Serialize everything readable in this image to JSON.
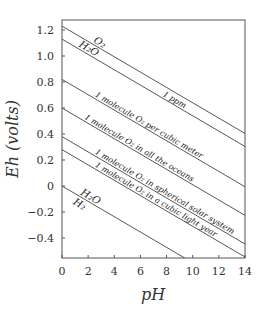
{
  "chart_data": {
    "type": "line",
    "title": "",
    "xlabel": "pH",
    "ylabel": "Eh  (volts)",
    "xlim": [
      0,
      14
    ],
    "ylim": [
      -0.55,
      1.28
    ],
    "xticks": [
      0,
      2,
      4,
      6,
      8,
      10,
      12,
      14
    ],
    "xtick_labels": [
      "0",
      "2",
      "4",
      "6",
      "8",
      "10",
      "12",
      "14"
    ],
    "yticks": [
      1.2,
      1.0,
      0.8,
      0.6,
      0.4,
      0.2,
      0,
      -0.2,
      -0.4
    ],
    "ytick_labels": [
      "1.2",
      "1.0",
      "0.8",
      "0.6",
      "0.4",
      "0.2",
      "0",
      "−0.2",
      "−0.4"
    ],
    "grid": false,
    "legend": "none (inline labels)",
    "slope_volts_per_pH": -0.059,
    "series": [
      {
        "name": "O2 / H2O",
        "label_top": "O₂",
        "label_bottom": "H₂O",
        "eh_at_pH0": 1.23,
        "x": [
          0,
          14
        ],
        "y": [
          1.23,
          0.4
        ]
      },
      {
        "name": "1 ppm",
        "label": "1 ppm",
        "eh_at_pH0": 1.13,
        "x": [
          0,
          14
        ],
        "y": [
          1.13,
          0.3
        ]
      },
      {
        "name": "1 molecule O2 per cubic meter",
        "label": "1 molecule O₂ per cubic meter",
        "eh_at_pH0": 0.82,
        "x": [
          0,
          14
        ],
        "y": [
          0.82,
          -0.01
        ]
      },
      {
        "name": "1 molecule O2 in all the oceans",
        "label": "1 molecule O₂ in all the oceans",
        "eh_at_pH0": 0.6,
        "x": [
          0,
          14
        ],
        "y": [
          0.6,
          -0.23
        ]
      },
      {
        "name": "1 molecule O2 in spherical solar system",
        "label": "1 molecule O₂ in spherical solar system",
        "eh_at_pH0": 0.38,
        "x": [
          0,
          14
        ],
        "y": [
          0.38,
          -0.45
        ]
      },
      {
        "name": "1 molecule O2 in a cubic light year",
        "label": "1 molecule O₂ in a cubic light year",
        "eh_at_pH0": 0.28,
        "x": [
          0,
          14
        ],
        "y": [
          0.28,
          -0.55
        ]
      },
      {
        "name": "H2O / H2",
        "label_top": "H₂O",
        "label_bottom": "H₂",
        "eh_at_pH0": 0.0,
        "x": [
          0,
          9.3
        ],
        "y": [
          0.0,
          -0.55
        ]
      }
    ]
  }
}
